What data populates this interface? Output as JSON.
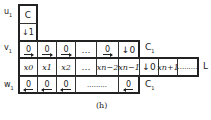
{
  "diagram": {
    "caption": "(h)",
    "row_labels": {
      "u": "u",
      "v": "v",
      "w": "w",
      "sub": "1"
    },
    "column_c": {
      "top": "C",
      "bottom": "↓1"
    },
    "v_row": {
      "cells": [
        "0",
        "0",
        "0",
        "…",
        "0",
        "↓0"
      ],
      "arrows": [
        "right",
        "right",
        "right",
        "",
        "right",
        "down"
      ],
      "label": "C",
      "label_sub": "1"
    },
    "l_row": {
      "cells": [
        "x",
        "x",
        "x",
        "…",
        "x",
        "x",
        "↓0",
        "x",
        "........."
      ],
      "subs": [
        "0",
        "1",
        "2",
        "",
        "n−2",
        "n−1",
        "",
        "n+1",
        ""
      ],
      "label": "L"
    },
    "w_row": {
      "cells": [
        "0",
        "0",
        "0",
        ".........",
        "0"
      ],
      "arrows": [
        "left",
        "left",
        "left",
        "",
        "left"
      ],
      "label": "C",
      "label_sub": "1"
    }
  }
}
